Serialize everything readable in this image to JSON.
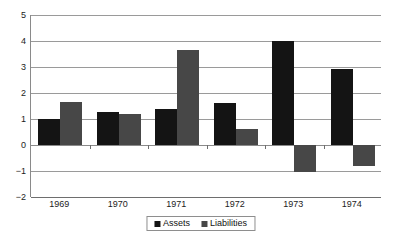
{
  "chart_data": {
    "type": "bar",
    "title": "",
    "subtitle": "",
    "xlabel": "",
    "ylabel": "",
    "categories": [
      "1969",
      "1970",
      "1971",
      "1972",
      "1973",
      "1974"
    ],
    "series": [
      {
        "name": "Assets",
        "color": "#141414",
        "values": [
          1.0,
          1.28,
          1.37,
          1.6,
          4.0,
          2.92
        ]
      },
      {
        "name": "Liabilities",
        "color": "#474747",
        "values": [
          1.65,
          1.2,
          3.66,
          0.62,
          -1.05,
          -0.8
        ]
      }
    ],
    "ylim": [
      -2,
      5
    ],
    "yticks": [
      5,
      4,
      3,
      2,
      1,
      0,
      -1,
      -2
    ],
    "ytick_labels": [
      "5",
      "4",
      "3",
      "2",
      "1",
      "0",
      "−1",
      "−2"
    ],
    "grid": true,
    "legend_position": "bottom"
  },
  "legend": {
    "items": [
      {
        "label": "Assets",
        "color": "#141414"
      },
      {
        "label": "Liabilities",
        "color": "#474747"
      }
    ]
  },
  "colors": {
    "assets": "#141414",
    "liabilities": "#474747",
    "gridline": "#9a9a9a",
    "axis": "#6e6e6e",
    "background": "#ffffff"
  }
}
